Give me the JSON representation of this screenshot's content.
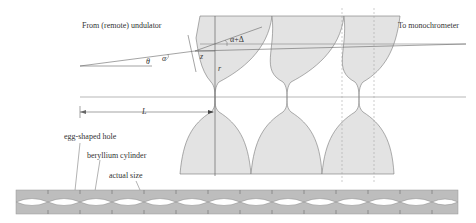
{
  "labels": {
    "source": "From (remote) undulator",
    "destination": "To monochrometer",
    "hole": "egg-shaped hole",
    "cylinder": "beryllium cylinder",
    "actual_size": "actual size"
  },
  "symbols": {
    "theta": "θ",
    "alpha": "α",
    "alpha_delta": "α+Δ",
    "z": "z",
    "r": "r",
    "L": "L"
  },
  "colors": {
    "fill": "#e3e3e3",
    "strip_fill": "#bdbdbd",
    "line": "#666666"
  }
}
